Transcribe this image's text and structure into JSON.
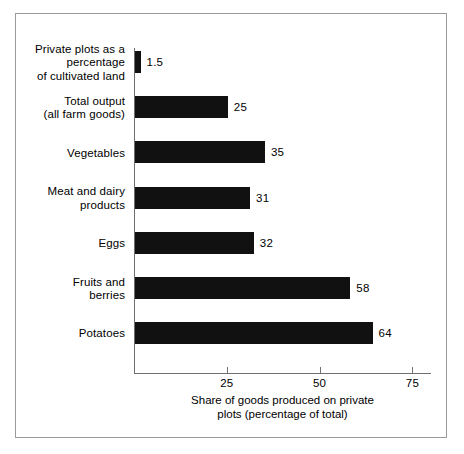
{
  "chart_data": {
    "type": "bar",
    "orientation": "horizontal",
    "title": "",
    "subtitle": "",
    "xlabel": "Share of goods produced on private\nplots (percentage of total)",
    "ylabel": "",
    "xlim": [
      0,
      80
    ],
    "xticks": [
      25,
      50,
      75
    ],
    "xtick_labels": [
      "25",
      "50",
      "75"
    ],
    "grid": false,
    "legend": null,
    "bar_color": "#111111",
    "axis_color": "#6f6f6f",
    "frame_color": "#9a9a9a",
    "background": "#ffffff",
    "categories": [
      "Private plots as a\npercentage\nof cultivated land",
      "Total output\n(all farm goods)",
      "Vegetables",
      "Meat and dairy\nproducts",
      "Eggs",
      "Fruits and\nberries",
      "Potatoes"
    ],
    "values": [
      1.5,
      25,
      35,
      31,
      32,
      58,
      64
    ],
    "value_labels": [
      "1.5",
      "25",
      "35",
      "31",
      "32",
      "58",
      "64"
    ]
  }
}
